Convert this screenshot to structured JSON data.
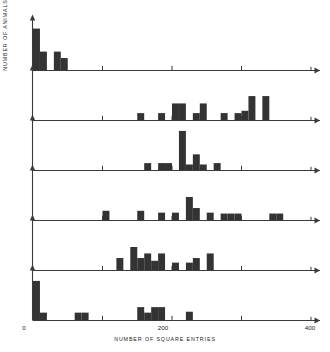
{
  "chart_data": {
    "type": "bar",
    "title": "",
    "subtitle": "",
    "xlabel": "NUMBER OF SQUARE ENTRIES",
    "ylabel": "NUMBER OF ANIMALS",
    "xlim": [
      0,
      400
    ],
    "xticks": [
      0,
      100,
      200,
      300,
      400
    ],
    "xtick_labels": [
      "0",
      "200",
      "400"
    ],
    "xtick_label_values": [
      0,
      200,
      400
    ],
    "minor_ticks": [
      100,
      300
    ],
    "grid": false,
    "legend": false,
    "bin_width": 10,
    "bar_color": "#333333",
    "axis_color": "#3a3a3a",
    "background": "#ffffff",
    "panel_count": 6,
    "ylim": [
      0,
      10
    ],
    "panels": [
      {
        "name": "panel-1",
        "ymax": 10,
        "bins": [
          {
            "x": 0,
            "value": 9
          },
          {
            "x": 10,
            "value": 4
          },
          {
            "x": 20,
            "value": 0
          },
          {
            "x": 30,
            "value": 4
          },
          {
            "x": 40,
            "value": 2.6
          }
        ]
      },
      {
        "name": "panel-2",
        "ymax": 10,
        "bins": [
          {
            "x": 150,
            "value": 1.5
          },
          {
            "x": 180,
            "value": 1.5
          },
          {
            "x": 200,
            "value": 3.6
          },
          {
            "x": 210,
            "value": 3.6
          },
          {
            "x": 230,
            "value": 1.5
          },
          {
            "x": 240,
            "value": 3.6
          },
          {
            "x": 270,
            "value": 1.5
          },
          {
            "x": 290,
            "value": 1.5
          },
          {
            "x": 300,
            "value": 2.0
          },
          {
            "x": 310,
            "value": 5.2
          },
          {
            "x": 330,
            "value": 5.2
          }
        ]
      },
      {
        "name": "panel-3",
        "ymax": 10,
        "bins": [
          {
            "x": 160,
            "value": 1.5
          },
          {
            "x": 180,
            "value": 1.5
          },
          {
            "x": 190,
            "value": 1.5
          },
          {
            "x": 210,
            "value": 8.5
          },
          {
            "x": 220,
            "value": 1.2
          },
          {
            "x": 230,
            "value": 3.4
          },
          {
            "x": 240,
            "value": 1.2
          },
          {
            "x": 260,
            "value": 1.5
          }
        ]
      },
      {
        "name": "panel-4",
        "ymax": 10,
        "bins": [
          {
            "x": 100,
            "value": 2.0
          },
          {
            "x": 150,
            "value": 2.0
          },
          {
            "x": 180,
            "value": 1.6
          },
          {
            "x": 200,
            "value": 1.6
          },
          {
            "x": 220,
            "value": 5.0
          },
          {
            "x": 230,
            "value": 2.6
          },
          {
            "x": 250,
            "value": 1.6
          },
          {
            "x": 270,
            "value": 1.4
          },
          {
            "x": 280,
            "value": 1.4
          },
          {
            "x": 290,
            "value": 1.4
          },
          {
            "x": 340,
            "value": 1.4
          },
          {
            "x": 350,
            "value": 1.4
          }
        ]
      },
      {
        "name": "panel-5",
        "ymax": 10,
        "bins": [
          {
            "x": 120,
            "value": 2.6
          },
          {
            "x": 140,
            "value": 5.0
          },
          {
            "x": 150,
            "value": 2.6
          },
          {
            "x": 160,
            "value": 3.6
          },
          {
            "x": 170,
            "value": 2.0
          },
          {
            "x": 180,
            "value": 3.6
          },
          {
            "x": 200,
            "value": 1.6
          },
          {
            "x": 220,
            "value": 1.6
          },
          {
            "x": 230,
            "value": 2.6
          },
          {
            "x": 250,
            "value": 3.6
          }
        ]
      },
      {
        "name": "panel-6",
        "ymax": 10,
        "bins": [
          {
            "x": 0,
            "value": 8.5
          },
          {
            "x": 10,
            "value": 1.6
          },
          {
            "x": 60,
            "value": 1.6
          },
          {
            "x": 70,
            "value": 1.6
          },
          {
            "x": 150,
            "value": 2.8
          },
          {
            "x": 160,
            "value": 1.6
          },
          {
            "x": 170,
            "value": 2.8
          },
          {
            "x": 180,
            "value": 2.8
          },
          {
            "x": 220,
            "value": 1.8
          }
        ]
      }
    ]
  },
  "axis": {
    "xlabel": "NUMBER OF SQUARE ENTRIES",
    "ylabel": "NUMBER OF ANIMALS",
    "tick_0": "0",
    "tick_200": "200",
    "tick_400": "400"
  }
}
